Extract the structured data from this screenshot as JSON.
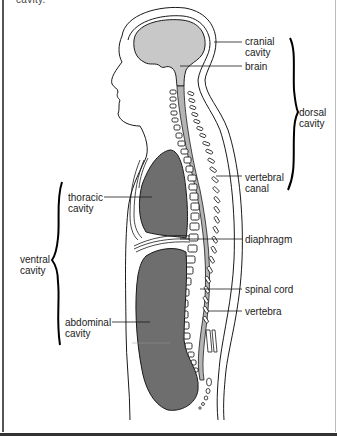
{
  "title_fragment": "cavity.",
  "labels": {
    "cranial_cavity": "cranial\ncavity",
    "brain": "brain",
    "dorsal_cavity": "dorsal\ncavity",
    "thoracic_cavity": "thoracic\ncavity",
    "vertebral_canal": "vertebral\ncanal",
    "diaphragm": "diaphragm",
    "ventral_cavity": "ventral\ncavity",
    "spinal_cord": "spinal cord",
    "vertebra": "vertebra",
    "abdominal_cavity": "abdominal\ncavity"
  },
  "colors": {
    "brain_fill": "#c8c8c8",
    "cavity_fill": "#6e6e6e",
    "spinal_fill": "#b4b4b4",
    "outline": "#1a1a1a"
  }
}
